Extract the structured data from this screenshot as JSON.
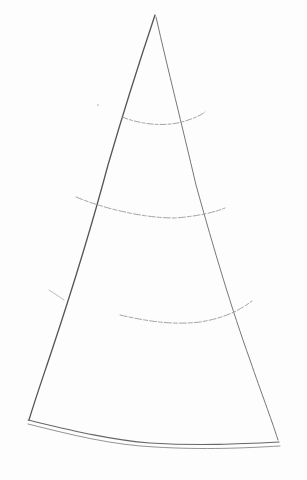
{
  "image": {
    "subject": "pencil sketch of a cone / triangle with three curved guide lines",
    "background": "#fdfdfd",
    "stroke_color": "#6a6a6a",
    "light_stroke_color": "#a8a8a8"
  }
}
